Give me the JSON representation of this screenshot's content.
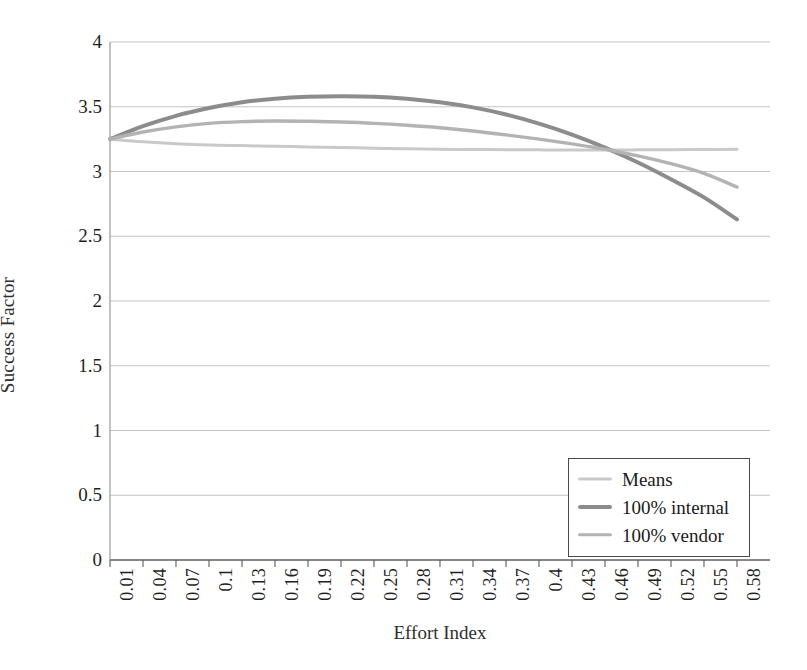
{
  "chart_data": {
    "type": "line",
    "title": "",
    "xlabel": "Effort Index",
    "ylabel": "Success Factor",
    "xlim": [
      0.01,
      0.61
    ],
    "ylim": [
      0,
      4
    ],
    "yticks": [
      "0",
      "0.5",
      "1",
      "1.5",
      "2",
      "2.5",
      "3",
      "3.5",
      "4"
    ],
    "ytick_values": [
      0,
      0.5,
      1,
      1.5,
      2,
      2.5,
      3,
      3.5,
      4
    ],
    "grid": "horizontal",
    "legend_position": "lower-right",
    "categories": [
      "0.01",
      "0.04",
      "0.07",
      "0.1",
      "0.13",
      "0.16",
      "0.19",
      "0.22",
      "0.25",
      "0.28",
      "0.31",
      "0.34",
      "0.37",
      "0.4",
      "0.43",
      "0.46",
      "0.49",
      "0.52",
      "0.55",
      "0.58"
    ],
    "x": [
      0.01,
      0.04,
      0.07,
      0.1,
      0.13,
      0.16,
      0.19,
      0.22,
      0.25,
      0.28,
      0.31,
      0.34,
      0.37,
      0.4,
      0.43,
      0.46,
      0.49,
      0.52,
      0.55,
      0.58
    ],
    "series": [
      {
        "name": "Means",
        "color": "#c9c9c9",
        "width": 3.0,
        "values": [
          3.25,
          3.23,
          3.215,
          3.205,
          3.2,
          3.195,
          3.19,
          3.185,
          3.18,
          3.175,
          3.172,
          3.17,
          3.168,
          3.167,
          3.166,
          3.166,
          3.167,
          3.168,
          3.17,
          3.172
        ]
      },
      {
        "name": "100% internal",
        "color": "#8c8c8c",
        "width": 4.0,
        "values": [
          3.25,
          3.35,
          3.43,
          3.49,
          3.535,
          3.562,
          3.577,
          3.582,
          3.578,
          3.562,
          3.535,
          3.495,
          3.44,
          3.37,
          3.285,
          3.185,
          3.07,
          2.94,
          2.8,
          2.63
        ]
      },
      {
        "name": "100% vendor",
        "color": "#b3b3b3",
        "width": 3.4,
        "values": [
          3.25,
          3.305,
          3.345,
          3.372,
          3.385,
          3.39,
          3.388,
          3.382,
          3.372,
          3.357,
          3.338,
          3.313,
          3.283,
          3.25,
          3.213,
          3.172,
          3.12,
          3.06,
          2.985,
          2.88
        ]
      }
    ]
  },
  "legend": {
    "items": [
      {
        "label": "Means"
      },
      {
        "label": "100% internal"
      },
      {
        "label": "100% vendor"
      }
    ]
  },
  "axes": {
    "y_title": "Success Factor",
    "x_title": "Effort Index"
  }
}
